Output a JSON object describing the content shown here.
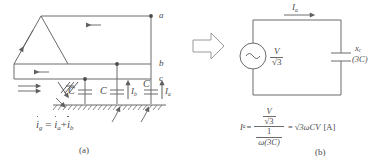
{
  "figure": {
    "title_hidden": "",
    "panels": [
      {
        "id": "a",
        "caption": "(a)"
      },
      {
        "id": "b",
        "caption": "(b)"
      }
    ],
    "colors": {
      "line": "#6b6b6b",
      "text": "#4a4a4a",
      "background": "#ffffff",
      "arrow_outline": "#9a9a9a"
    }
  },
  "panel_a": {
    "caption": "(a)",
    "node_labels": [
      {
        "name": "a",
        "text": "a"
      },
      {
        "name": "b",
        "text": "b"
      },
      {
        "name": "c",
        "text": "c"
      }
    ],
    "capacitors": [
      {
        "name": "cap-1",
        "label": "C"
      },
      {
        "name": "cap-2",
        "label": "C"
      },
      {
        "name": "cap-3",
        "label": "C"
      }
    ],
    "current_labels": [
      {
        "name": "current-ib",
        "symbol": "I",
        "sub": "b"
      },
      {
        "name": "current-ia",
        "symbol": "I",
        "sub": "a"
      }
    ],
    "equation": {
      "lhs_symbol": "i",
      "lhs_sub": "g",
      "eq": "=",
      "term1_symbol": "i",
      "term1_sub": "a",
      "plus": "+",
      "term2_symbol": "i",
      "term2_sub": "b"
    }
  },
  "transition": {
    "arrow_name": "block-arrow-right",
    "direction": "right"
  },
  "panel_b": {
    "caption": "(b)",
    "source": {
      "name": "ac-voltage-source",
      "glyph": "∿",
      "label_numerator": "V",
      "label_denominator": "√3"
    },
    "capacitor": {
      "name": "capacitor-xc",
      "label_main": "x",
      "label_sub": "c",
      "label_value": "(3C)"
    },
    "current_top": {
      "name": "current-ia-top",
      "symbol": "I",
      "sub": "a"
    },
    "equation": {
      "lhs_symbol": "I",
      "lhs_sub": "a",
      "eq1": "=",
      "numerator_top": "V",
      "numerator_bottom": "√3",
      "denominator_top": "1",
      "denominator_bottom": "ω(3C)",
      "eq2": "=",
      "result": "√3ωCV",
      "unit": "[A]"
    }
  }
}
